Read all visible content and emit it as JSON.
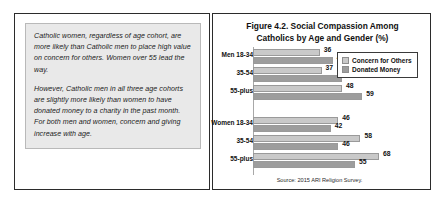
{
  "callout": {
    "paragraphs": [
      "Catholic women, regardless of age cohort, are more likely than Catholic men to place high value on concern for others. Women over 55 lead the way.",
      "However, Catholic men in all three age cohorts are slightly more likely than women to have donated money to a charity in the past month. For both men and women, concern and giving increase with age."
    ]
  },
  "chart_data": {
    "type": "bar",
    "orientation": "horizontal",
    "title": "Figure 4.2. Social Compassion Among Catholics by Age and Gender (%)",
    "title_line1": "Figure 4.2. Social Compassion Among",
    "title_line2": "Catholics by Age and Gender (%)",
    "xlabel": "",
    "ylabel": "",
    "xlim": [
      0,
      75
    ],
    "grid": false,
    "legend_position": "top-right",
    "source": "Source: 2015 ARI Religion Survey.",
    "categories": [
      "Men 18-34",
      "35-54",
      "55-plus",
      "Women 18-34",
      "35-54",
      "55-plus"
    ],
    "series": [
      {
        "name": "Concern for Others",
        "color": "#c9c9c9",
        "values": [
          36,
          37,
          48,
          46,
          58,
          68
        ]
      },
      {
        "name": "Donated Money",
        "color": "#9d9d9d",
        "values": [
          43,
          48,
          59,
          42,
          46,
          55
        ]
      }
    ],
    "rows": [
      {
        "label": "Men 18-34",
        "concern": 36,
        "donated": 43,
        "group": "Men"
      },
      {
        "label": "35-54",
        "concern": 37,
        "donated": 48,
        "group": "Men"
      },
      {
        "label": "55-plus",
        "concern": 48,
        "donated": 59,
        "group": "Men"
      },
      {
        "label": "Women 18-34",
        "concern": 46,
        "donated": 42,
        "group": "Women"
      },
      {
        "label": "35-54",
        "concern": 58,
        "donated": 46,
        "group": "Women"
      },
      {
        "label": "55-plus",
        "concern": 68,
        "donated": 55,
        "group": "Women"
      }
    ]
  }
}
